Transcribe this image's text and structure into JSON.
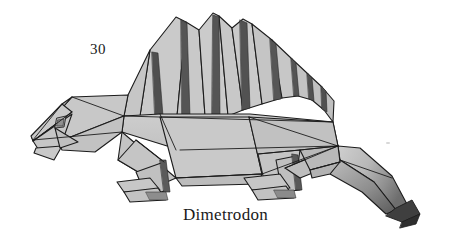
{
  "page": {
    "background_color": "#ffffff",
    "width": 451,
    "height": 243,
    "kind": "scanned-book-illustration"
  },
  "figure": {
    "number": "30",
    "caption": "Dimetrodon",
    "style": "grayscale folded-paper polygon diagram",
    "palette": {
      "paper_light": "#d2d2d2",
      "paper_mid": "#bdbdbd",
      "paper_shadow": "#9a9a9a",
      "paper_dark": "#6a6a6a",
      "pleat_dark": "#4f4f4f",
      "tail_tip_dark": "#3d3d3d",
      "crease_line": "#1c1c1c",
      "text_color": "#1a1a1a",
      "speck_color": "#d8d8d8"
    },
    "parts": [
      {
        "name": "sail",
        "label": "dorsal sail with pleated spines"
      },
      {
        "name": "head",
        "label": "head with eye fold"
      },
      {
        "name": "neck",
        "label": "neck"
      },
      {
        "name": "body",
        "label": "torso"
      },
      {
        "name": "front-leg",
        "label": "front leg and foot"
      },
      {
        "name": "rear-leg",
        "label": "rear leg and foot"
      },
      {
        "name": "tail",
        "label": "curving tapered tail"
      }
    ]
  }
}
